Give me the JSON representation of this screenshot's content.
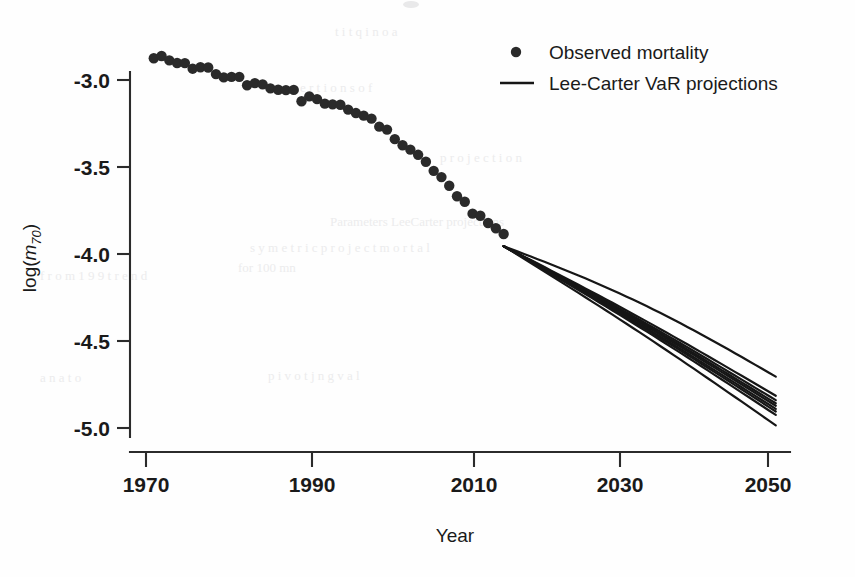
{
  "figure": {
    "background_color": "#ffffff",
    "foreground_color": "#1a1a1a",
    "width": 855,
    "height": 577
  },
  "axes": {
    "x_title": "Year",
    "y_title_prefix": "log(",
    "y_title_var": "m",
    "y_title_sub": "70",
    "y_title_suffix": ")",
    "x_tick_labels": [
      "1970",
      "1990",
      "2010",
      "2030",
      "2050"
    ],
    "y_tick_labels": [
      "-3.0",
      "-3.5",
      "-4.0",
      "-4.5",
      "-5.0"
    ]
  },
  "legend": {
    "position": "top-right",
    "items": [
      {
        "marker": "point",
        "label": "Observed mortality"
      },
      {
        "marker": "line",
        "label": "Lee-Carter VaR projections"
      }
    ]
  },
  "chart_data": {
    "type": "scatter",
    "title": "",
    "subtitle": "",
    "xlabel": "Year",
    "ylabel": "log(m70)",
    "xlim": [
      1968,
      2052
    ],
    "ylim": [
      -5.15,
      -2.75
    ],
    "x_ticks": [
      1970,
      1990,
      2010,
      2030,
      2050
    ],
    "y_ticks": [
      -3.0,
      -3.5,
      -4.0,
      -4.5,
      -5.0
    ],
    "grid": false,
    "legend_position": "top-right",
    "series": [
      {
        "name": "Observed mortality",
        "type": "scatter",
        "marker": "filled-circle",
        "color": "#2a2a2a",
        "x": [
          1971,
          1972,
          1973,
          1974,
          1975,
          1976,
          1977,
          1978,
          1979,
          1980,
          1981,
          1982,
          1983,
          1984,
          1985,
          1986,
          1987,
          1988,
          1989,
          1990,
          1991,
          1992,
          1993,
          1994,
          1995,
          1996,
          1997,
          1998,
          1999,
          2000,
          2001,
          2002,
          2003,
          2004,
          2005,
          2006,
          2007,
          2008,
          2009,
          2010,
          2011,
          2012,
          2013,
          2014,
          2015,
          2016
        ],
        "y": [
          -2.875,
          -2.862,
          -2.887,
          -2.902,
          -2.903,
          -2.935,
          -2.927,
          -2.928,
          -2.966,
          -2.985,
          -2.982,
          -2.982,
          -3.03,
          -3.018,
          -3.025,
          -3.048,
          -3.056,
          -3.058,
          -3.057,
          -3.122,
          -3.094,
          -3.11,
          -3.136,
          -3.14,
          -3.142,
          -3.17,
          -3.19,
          -3.205,
          -3.222,
          -3.268,
          -3.285,
          -3.34,
          -3.375,
          -3.4,
          -3.43,
          -3.47,
          -3.522,
          -3.558,
          -3.608,
          -3.668,
          -3.7,
          -3.768,
          -3.78,
          -3.822,
          -3.852,
          -3.885
        ],
        "note": "Observed log central death rate at age 70, 1971-2016"
      },
      {
        "name": "Lee-Carter VaR projections",
        "type": "line",
        "color": "#161616",
        "fan_origin": {
          "x": 2016,
          "y": -3.955
        },
        "fan_end_x": 2051,
        "fan_end_y_values": [
          -4.705,
          -4.815,
          -4.84,
          -4.858,
          -4.872,
          -4.89,
          -4.905,
          -4.925,
          -4.985
        ],
        "note": "Nine projection trajectories fanning out from 2016 to 2051"
      }
    ]
  }
}
